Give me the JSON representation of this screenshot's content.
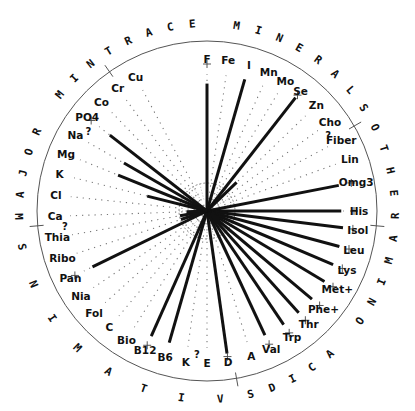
{
  "chart_data": {
    "type": "radial-bar",
    "title": "",
    "center": [
      207,
      211
    ],
    "outer_radius": 170,
    "target_radius": 137,
    "groups": [
      {
        "name": "TRACE MINERALS",
        "start_deg": -35,
        "end_deg": 60
      },
      {
        "name": "OTHER",
        "start_deg": 60,
        "end_deg": 95
      },
      {
        "name": "AMINO ACIDS",
        "start_deg": 95,
        "end_deg": 170
      },
      {
        "name": "VITAMINS",
        "start_deg": 170,
        "end_deg": 265
      },
      {
        "name": "MAJOR MIN",
        "start_deg": 265,
        "end_deg": 325
      }
    ],
    "spokes": [
      {
        "label": "F",
        "angle": 0,
        "value": 0.93,
        "target": true,
        "unknown": false
      },
      {
        "label": "Fe",
        "angle": 8,
        "value": 0,
        "target": false,
        "unknown": false
      },
      {
        "label": "I",
        "angle": 16,
        "value": 1.0,
        "target": false,
        "unknown": false
      },
      {
        "label": "Mn",
        "angle": 24,
        "value": 0,
        "target": false,
        "unknown": false
      },
      {
        "label": "Mo",
        "angle": 31,
        "value": 0,
        "target": false,
        "unknown": false
      },
      {
        "label": "Se",
        "angle": 38,
        "value": 1.05,
        "target": true,
        "unknown": false
      },
      {
        "label": "Zn",
        "angle": 46,
        "value": 0.3,
        "target": false,
        "unknown": false
      },
      {
        "label": "Cho",
        "angle": 54,
        "value": 0,
        "target": false,
        "unknown": false
      },
      {
        "label": "Fiber",
        "angle": 62,
        "value": 0,
        "target": false,
        "unknown": true
      },
      {
        "label": "Lin",
        "angle": 70,
        "value": 0,
        "target": false,
        "unknown": false
      },
      {
        "label": "Omg3",
        "angle": 79,
        "value": 0.98,
        "target": true,
        "unknown": false
      },
      {
        "label": "His",
        "angle": 90,
        "value": 0.98,
        "target": true,
        "unknown": false
      },
      {
        "label": "Isol",
        "angle": 97,
        "value": 1.0,
        "target": true,
        "unknown": false
      },
      {
        "label": "Leu",
        "angle": 105,
        "value": 1.0,
        "target": true,
        "unknown": false
      },
      {
        "label": "Lys",
        "angle": 113,
        "value": 1.0,
        "target": true,
        "unknown": false
      },
      {
        "label": "Met+",
        "angle": 121,
        "value": 1.0,
        "target": true,
        "unknown": false
      },
      {
        "label": "Phe+",
        "angle": 130,
        "value": 1.0,
        "target": true,
        "unknown": false
      },
      {
        "label": "Thr",
        "angle": 138,
        "value": 1.0,
        "target": true,
        "unknown": false
      },
      {
        "label": "Trp",
        "angle": 146,
        "value": 1.0,
        "target": true,
        "unknown": false
      },
      {
        "label": "Val",
        "angle": 155,
        "value": 1.0,
        "target": true,
        "unknown": false
      },
      {
        "label": "A",
        "angle": 163,
        "value": 0,
        "target": false,
        "unknown": false
      },
      {
        "label": "D",
        "angle": 172,
        "value": 1.05,
        "target": true,
        "unknown": false
      },
      {
        "label": "E",
        "angle": 180,
        "value": 0,
        "target": false,
        "unknown": false
      },
      {
        "label": "K",
        "angle": 188,
        "value": 0,
        "target": false,
        "unknown": true
      },
      {
        "label": "B6",
        "angle": 196,
        "value": 1.0,
        "target": false,
        "unknown": false
      },
      {
        "label": "B12",
        "angle": 204,
        "value": 1.0,
        "target": true,
        "unknown": false
      },
      {
        "label": "Bio",
        "angle": 212,
        "value": 0,
        "target": false,
        "unknown": false
      },
      {
        "label": "C",
        "angle": 220,
        "value": 0,
        "target": false,
        "unknown": false
      },
      {
        "label": "Fol",
        "angle": 228,
        "value": 0,
        "target": false,
        "unknown": false
      },
      {
        "label": "Nia",
        "angle": 236,
        "value": 0,
        "target": false,
        "unknown": false
      },
      {
        "label": "Pan",
        "angle": 244,
        "value": 0.93,
        "target": true,
        "unknown": false
      },
      {
        "label": "Ribo",
        "angle": 252,
        "value": 0.2,
        "target": false,
        "unknown": false
      },
      {
        "label": "Thia",
        "angle": 260,
        "value": 0.2,
        "target": false,
        "unknown": false
      },
      {
        "label": "Ca",
        "angle": 268,
        "value": 0.15,
        "target": false,
        "unknown": true
      },
      {
        "label": "Cl",
        "angle": 276,
        "value": 0,
        "target": false,
        "unknown": false
      },
      {
        "label": "K",
        "angle": 284,
        "value": 0.45,
        "target": false,
        "unknown": false
      },
      {
        "label": "Mg",
        "angle": 292,
        "value": 0.7,
        "target": false,
        "unknown": false
      },
      {
        "label": "Na",
        "angle": 300,
        "value": 0.7,
        "target": false,
        "unknown": false
      },
      {
        "label": "PO4",
        "angle": 308,
        "value": 0.9,
        "target": true,
        "unknown": true
      },
      {
        "label": "Co",
        "angle": 316,
        "value": 0,
        "target": false,
        "unknown": false
      },
      {
        "label": "Cr",
        "angle": 324,
        "value": 0,
        "target": false,
        "unknown": false
      },
      {
        "label": "Cu",
        "angle": 332,
        "value": 0,
        "target": false,
        "unknown": false
      }
    ]
  }
}
